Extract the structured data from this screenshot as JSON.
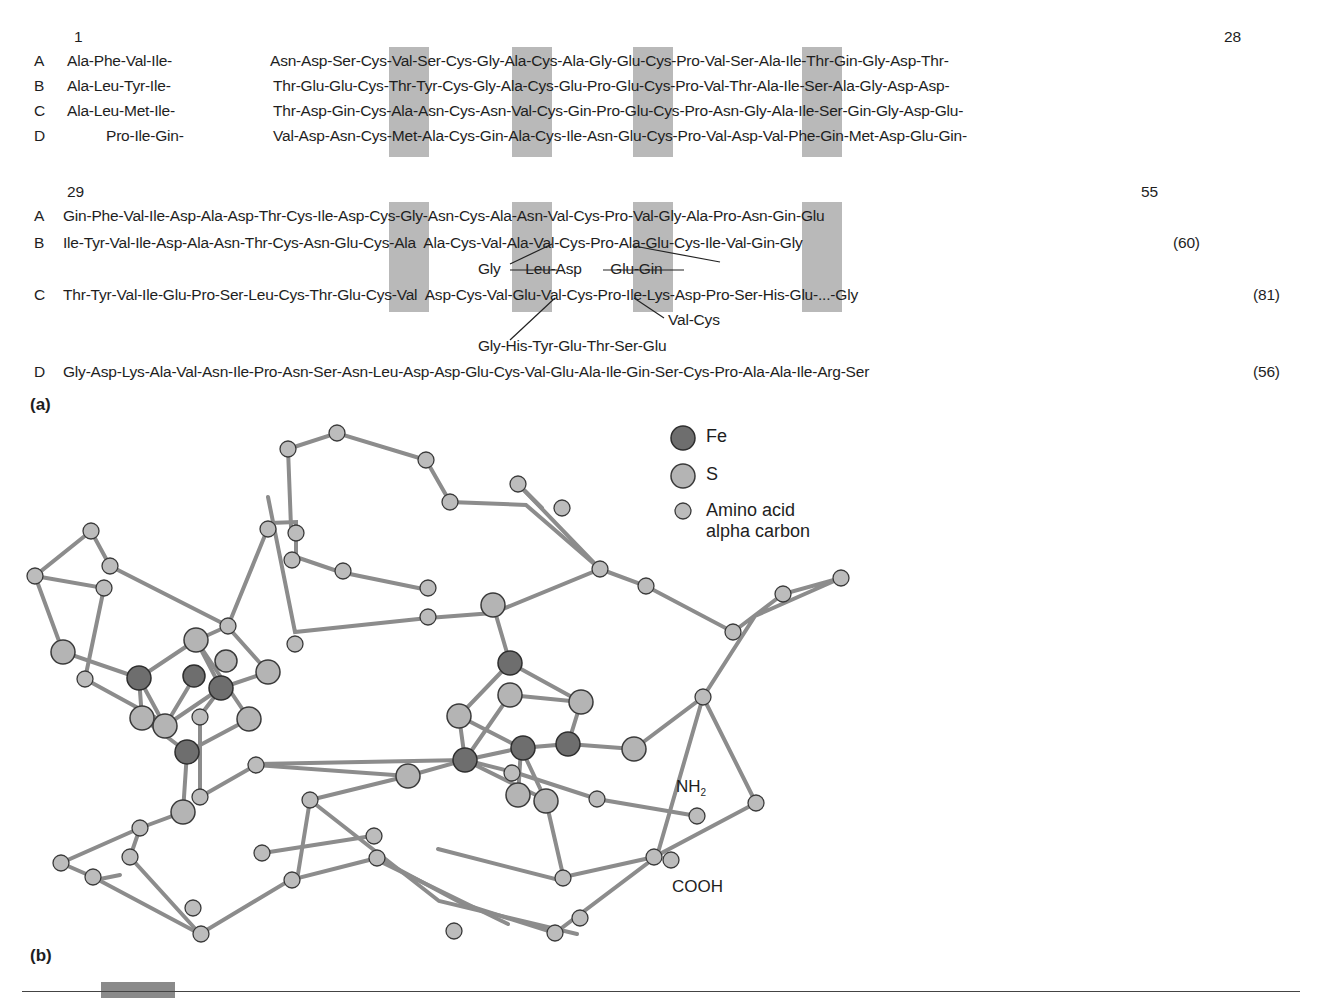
{
  "panel_a": {
    "label": "(a)",
    "block1": {
      "start_number": "1",
      "end_number": "28",
      "rows": [
        {
          "id": "A",
          "prefix": "Ala-Phe-Val-Ile-",
          "segments": [
            "Asn-Asp-Ser-",
            "Cys",
            "-Val-Ser-",
            "Cys",
            "-Gly-Ala-",
            "Cys",
            "-Ala-Gly-Glu-",
            "Cys",
            "-Pro-Val-Ser-Ala-Ile-Thr-Gin-Gly-Asp-Thr-"
          ]
        },
        {
          "id": "B",
          "prefix": "Ala-Leu-Tyr-Ile-",
          "segments": [
            "Thr-Glu-Glu-",
            "Cys",
            "-Thr-Tyr-",
            "Cys",
            "-Gly-Ala-",
            "Cys",
            "-Glu-Pro-Glu-",
            "Cys",
            "-Pro-Val-Thr-Ala-Ile-Ser-Ala-Gly-Asp-Asp-"
          ]
        },
        {
          "id": "C",
          "prefix": "Ala-Leu-Met-Ile-",
          "segments": [
            "Thr-Asp-Gin-",
            "Cys",
            "-Ala-Asn-",
            "Cys",
            "-Asn-Val-",
            "Cys",
            "-Gin-Pro-Glu-",
            "Cys",
            "-Pro-Asn-Gly-Ala-Ile-Ser-Gin-Gly-Asp-Glu-"
          ]
        },
        {
          "id": "D",
          "prefix": "Pro-Ile-Gin-",
          "segments": [
            "Val-Asp-Asn-",
            "Cys",
            "-Met-Ala-",
            "Cys",
            "-Gin-Ala-",
            "Cys",
            "-Ile-Asn-Glu-",
            "Cys",
            "-Pro-Val-Asp-Val-Phe-Gin-Met-Asp-Glu-Gin-"
          ]
        }
      ]
    },
    "block2": {
      "start_number": "29",
      "end_number": "55",
      "rows": [
        {
          "id": "A",
          "text": "Gin-Phe-Val-Ile-Asp-Ala-Asp-Thr-Cys-Ile-Asp-Cys-Gly-Asn-Cys-Ala-Asn-Val-Cys-Pro-Val-Gly-Ala-Pro-Asn-Gin-Glu",
          "length": ""
        },
        {
          "id": "B",
          "text": "Ile-Tyr-Val-Ile-Asp-Ala-Asn-Thr-Cys-Asn-Glu-Cys-Ala  Ala-Cys-Val-Ala-Val-Cys-Pro-Ala-Glu-Cys-Ile-Val-Gin-Gly",
          "length": "(60)"
        },
        {
          "id": "B-insert",
          "text": "Gly      Leu-Asp       Glu-Gin",
          "length": ""
        },
        {
          "id": "C",
          "text": "Thr-Tyr-Val-Ile-Glu-Pro-Ser-Leu-Cys-Thr-Glu-Cys-Val  Asp-Cys-Val-Glu-Val-Cys-Pro-Ile-Lys-Asp-Pro-Ser-His-Glu-...-Gly",
          "length": "(81)"
        },
        {
          "id": "C-insert-1",
          "text": "Val-Cys",
          "length": ""
        },
        {
          "id": "C-insert-2",
          "text": "Gly-His-Tyr-Glu-Thr-Ser-Glu",
          "length": ""
        },
        {
          "id": "D",
          "text": "Gly-Asp-Lys-Ala-Val-Asn-Ile-Pro-Asn-Ser-Asn-Leu-Asp-Asp-Glu-Cys-Val-Glu-Ala-Ile-Gin-Ser-Cys-Pro-Ala-Ala-Ile-Arg-Ser",
          "length": "(56)"
        }
      ]
    },
    "highlight_color": "#b9b9b9"
  },
  "panel_b": {
    "label": "(b)",
    "legend": [
      {
        "symbol": "fe-atom",
        "label": "Fe",
        "color": "#6e6e6e"
      },
      {
        "symbol": "s-atom",
        "label": "S",
        "color": "#b4b4b4"
      },
      {
        "symbol": "alpha-carbon",
        "label_line1": "Amino acid",
        "label_line2": "alpha carbon",
        "color": "#bcbcbc"
      }
    ],
    "terminus_labels": {
      "n_terminus": "NH",
      "n_sub": "2",
      "c_terminus": "COOH"
    },
    "bond_color": "#8c8c8c"
  }
}
